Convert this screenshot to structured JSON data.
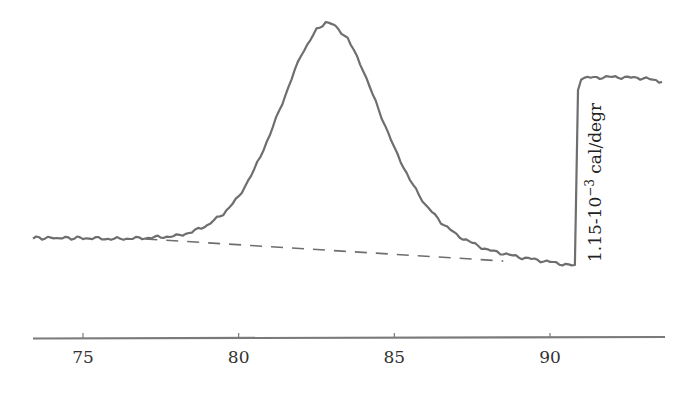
{
  "chart_data": {
    "type": "line",
    "title": "",
    "xlabel": "",
    "ylabel": "",
    "xlim": [
      73.4,
      93.8
    ],
    "x_ticks": [
      75,
      80,
      85,
      90
    ],
    "x_tick_labels": [
      "75",
      "80",
      "85",
      "90"
    ],
    "grid": false,
    "legend": null,
    "annotations": [
      {
        "text": "1.15·10^-3 cal/degr",
        "base": "1.15-10",
        "exponent": "−3",
        "unit": " cal/degr",
        "orientation": "vertical",
        "position": "right of step at ~91"
      }
    ],
    "series": [
      {
        "name": "heat capacity trace",
        "style": "solid",
        "x": [
          73.4,
          75,
          76,
          77,
          78,
          78.5,
          79,
          79.5,
          80,
          80.5,
          81,
          81.5,
          82,
          82.5,
          82.8,
          83,
          83.5,
          84,
          84.5,
          85,
          85.5,
          86,
          86.5,
          87,
          87.5,
          88,
          89,
          90,
          90.8,
          90.9,
          91.0,
          92,
          93,
          93.6
        ],
        "y_px": [
          238,
          238,
          239,
          238,
          236,
          232,
          225,
          214,
          197,
          170,
          135,
          95,
          55,
          30,
          22,
          24,
          38,
          70,
          110,
          148,
          180,
          205,
          222,
          235,
          243,
          250,
          257,
          262,
          266,
          90,
          78,
          77,
          78,
          82
        ],
        "y_rel": [
          0.0,
          0.0,
          -0.005,
          0.0,
          0.01,
          0.03,
          0.07,
          0.12,
          0.21,
          0.35,
          0.53,
          0.74,
          0.94,
          1.07,
          1.11,
          1.1,
          1.03,
          0.87,
          0.66,
          0.46,
          0.3,
          0.17,
          0.08,
          0.02,
          -0.03,
          -0.06,
          -0.1,
          -0.12,
          -0.14,
          0.76,
          0.82,
          0.83,
          0.82,
          0.8
        ]
      },
      {
        "name": "baseline",
        "style": "dashed",
        "x": [
          77.0,
          88.5
        ],
        "y_px": [
          239,
          261
        ]
      }
    ],
    "scale_bar": {
      "value": "1.15e-3",
      "unit": "cal/degr",
      "from_y_px": 266,
      "to_y_px": 78
    }
  }
}
